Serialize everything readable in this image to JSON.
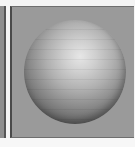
{
  "figure": {
    "panel_content": "shaded-sphere",
    "colors": {
      "background": "#9a9a9a",
      "border": "#4a4a4a",
      "sphere_highlight": "#e6e6e6",
      "sphere_shadow": "#3c3c3c",
      "page": "#f4f4f4"
    }
  }
}
